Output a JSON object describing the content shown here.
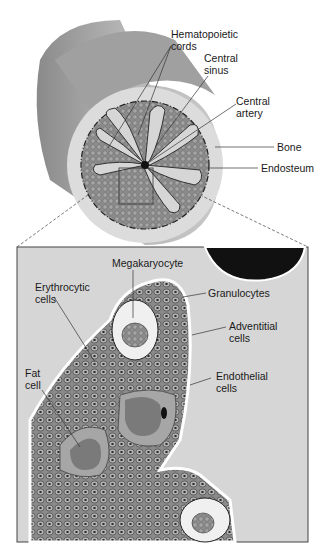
{
  "figure": {
    "overview": {
      "labels": {
        "hematopoietic_cords": "Hematopoietic\ncords",
        "central_sinus": "Central\nsinus",
        "central_artery": "Central\nartery",
        "bone": "Bone",
        "endosteum": "Endosteum"
      }
    },
    "inset": {
      "labels": {
        "megakaryocyte": "Megakaryocyte",
        "erythrocytic_cells": "Erythrocytic\ncells",
        "granulocytes": "Granulocytes",
        "adventitial_cells": "Adventitial\ncells",
        "fat_cell": "Fat\ncell",
        "endothelial_cells": "Endothelial\ncells"
      }
    },
    "caption": "Figure 7-2 (partially visible, truncated)",
    "colors": {
      "bone_outer": "#a8a8a8",
      "bone_face": "#dcdcdc",
      "marrow": "#8e8e8e",
      "sinus": "#d4d4d4",
      "inset_bg": "#d6d6d6",
      "fat": "#7a7a7a",
      "fat_rim": "#a6a6a6",
      "artery": "#111111"
    }
  }
}
